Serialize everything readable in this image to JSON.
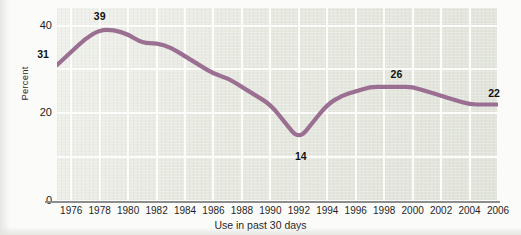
{
  "chart_data": {
    "type": "line",
    "title": "",
    "subtitle": "",
    "xlabel": "Use in past 30 days",
    "ylabel": "Percent",
    "xlim": [
      1975,
      2006
    ],
    "ylim": [
      0,
      44
    ],
    "grid": true,
    "legend": "none",
    "line_color": "#9a6f92",
    "plot_background": "#e7e9e1",
    "gridline_color": "#fdfdfc",
    "x": [
      1975,
      1976,
      1977,
      1978,
      1979,
      1980,
      1981,
      1982,
      1983,
      1984,
      1985,
      1986,
      1987,
      1988,
      1989,
      1990,
      1991,
      1992,
      1993,
      1994,
      1995,
      1996,
      1997,
      1998,
      1999,
      2000,
      2001,
      2002,
      2003,
      2004,
      2005,
      2006
    ],
    "series": [
      {
        "name": "Percent",
        "values": [
          31,
          34,
          37,
          39,
          39,
          38,
          36,
          36,
          35,
          33,
          31,
          29,
          28,
          26,
          24,
          22,
          18,
          14,
          18,
          22,
          24,
          25,
          26,
          26,
          26,
          26,
          25,
          24,
          23,
          22,
          22,
          22
        ]
      }
    ],
    "xticks": [
      1976,
      1978,
      1980,
      1982,
      1984,
      1986,
      1988,
      1990,
      1992,
      1994,
      1996,
      1998,
      2000,
      2002,
      2004,
      2006
    ],
    "xtick_labels": [
      "1976",
      "1978",
      "1980",
      "1982",
      "1984",
      "1986",
      "1988",
      "1990",
      "1992",
      "1994",
      "1996",
      "1998",
      "2000",
      "2002",
      "2004",
      "2006"
    ],
    "yticks": [
      0,
      20,
      40
    ],
    "ytick_labels": [
      "0",
      "20",
      "40"
    ],
    "annotations": [
      {
        "label": "31",
        "x": 1975,
        "y": 31
      },
      {
        "label": "39",
        "x": 1978,
        "y": 39
      },
      {
        "label": "14",
        "x": 1992,
        "y": 14
      },
      {
        "label": "26",
        "x": 1999,
        "y": 26
      },
      {
        "label": "22",
        "x": 2006,
        "y": 22
      }
    ]
  }
}
